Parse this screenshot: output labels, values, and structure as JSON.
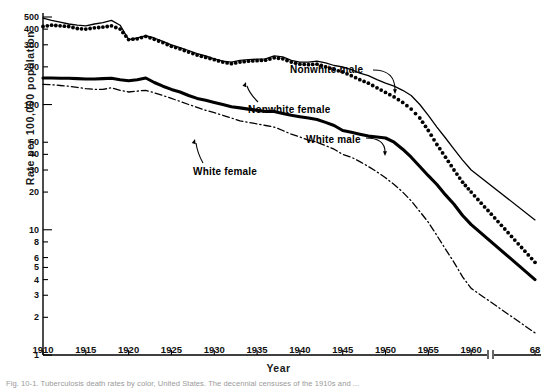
{
  "figure": {
    "xlabel": "Year",
    "ylabel": "Rate per 100,000 population",
    "caption": "Fig. 10-1. Tuberculosis death rates by color, United States. The decennial censuses of the 1910s and ..."
  },
  "annotations": {
    "nonwhite_male": "Nonwhite male",
    "nonwhite_female": "Nonwhite female",
    "white_male": "White male",
    "white_female": "White female"
  },
  "axis": {
    "y_ticks": [
      "1",
      "2",
      "3",
      "4",
      "5",
      "6",
      "8",
      "10",
      "20",
      "30",
      "40",
      "50",
      "100",
      "200",
      "300",
      "400",
      "500"
    ],
    "x_ticks": [
      "1910",
      "1915",
      "1920",
      "1925",
      "1930",
      "1935",
      "1940",
      "1945",
      "1950",
      "1955",
      "1960",
      "68"
    ]
  },
  "chart_data": {
    "type": "line",
    "title": "",
    "xlabel": "Year",
    "ylabel": "Rate per 100,000 population",
    "yscale": "log",
    "ylim": [
      1,
      560
    ],
    "xlim": [
      1910,
      1968
    ],
    "grid": false,
    "legend": "inline-annotations",
    "axis_break": {
      "after": 1961.5,
      "before": 1968,
      "note": "x-axis break between 1960 and 68"
    },
    "y_ticks": [
      1,
      2,
      3,
      4,
      5,
      6,
      8,
      10,
      20,
      30,
      40,
      50,
      100,
      200,
      300,
      400,
      500
    ],
    "x_ticks": [
      1910,
      1915,
      1920,
      1925,
      1930,
      1935,
      1940,
      1945,
      1950,
      1955,
      1960,
      1968
    ],
    "x": [
      1910,
      1911,
      1912,
      1913,
      1914,
      1915,
      1916,
      1917,
      1918,
      1919,
      1920,
      1921,
      1922,
      1923,
      1924,
      1925,
      1926,
      1927,
      1928,
      1929,
      1930,
      1931,
      1932,
      1933,
      1934,
      1935,
      1936,
      1937,
      1938,
      1939,
      1940,
      1941,
      1942,
      1943,
      1944,
      1945,
      1946,
      1947,
      1948,
      1949,
      1950,
      1951,
      1952,
      1953,
      1954,
      1955,
      1956,
      1957,
      1958,
      1959,
      1960,
      1968
    ],
    "series": [
      {
        "name": "Nonwhite male",
        "style": "thin-solid",
        "values": [
          490,
          470,
          455,
          440,
          430,
          425,
          440,
          450,
          470,
          430,
          330,
          340,
          355,
          340,
          320,
          300,
          285,
          270,
          255,
          245,
          232,
          222,
          218,
          225,
          228,
          230,
          232,
          245,
          240,
          225,
          218,
          218,
          222,
          215,
          205,
          200,
          190,
          178,
          170,
          158,
          148,
          140,
          130,
          118,
          100,
          82,
          66,
          54,
          44,
          36,
          30,
          12
        ]
      },
      {
        "name": "Nonwhite female",
        "style": "dotted",
        "values": [
          420,
          430,
          425,
          420,
          405,
          400,
          410,
          415,
          425,
          400,
          330,
          335,
          350,
          332,
          312,
          292,
          278,
          262,
          248,
          238,
          228,
          218,
          212,
          218,
          222,
          224,
          226,
          236,
          232,
          218,
          210,
          208,
          210,
          200,
          190,
          182,
          170,
          158,
          148,
          136,
          125,
          115,
          104,
          92,
          78,
          62,
          48,
          38,
          30,
          24,
          20,
          5.5
        ]
      },
      {
        "name": "White male",
        "style": "thick-solid",
        "values": [
          163,
          163,
          162,
          162,
          161,
          160,
          160,
          161,
          162,
          158,
          155,
          158,
          163,
          150,
          140,
          132,
          126,
          118,
          112,
          108,
          104,
          100,
          96,
          94,
          92,
          90,
          88,
          88,
          85,
          82,
          80,
          78,
          76,
          72,
          68,
          62,
          60,
          58,
          56,
          55,
          54,
          50,
          44,
          38,
          32,
          27,
          23,
          19,
          16,
          13,
          11,
          4
        ]
      },
      {
        "name": "White female",
        "style": "dash-dot",
        "values": [
          145,
          144,
          142,
          140,
          137,
          134,
          132,
          132,
          136,
          130,
          126,
          128,
          130,
          124,
          118,
          112,
          106,
          100,
          95,
          90,
          86,
          82,
          78,
          74,
          72,
          70,
          68,
          66,
          62,
          58,
          55,
          52,
          50,
          47,
          44,
          40,
          38,
          35,
          32,
          29,
          26,
          23,
          20,
          17,
          14,
          11.5,
          9,
          7,
          5.5,
          4.2,
          3.4,
          1.5
        ]
      }
    ]
  }
}
